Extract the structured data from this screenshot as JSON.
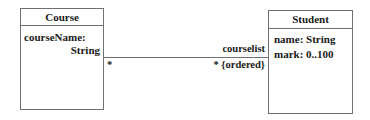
{
  "diagram": {
    "type": "UML class diagram",
    "classes": [
      {
        "name": "Course",
        "attributes": [
          {
            "line1": "courseName:",
            "line2": "String"
          }
        ]
      },
      {
        "name": "Student",
        "attributes": [
          {
            "text": "name: String"
          },
          {
            "text": "mark: 0..100"
          }
        ]
      }
    ],
    "association": {
      "source": "Course",
      "target": "Student",
      "source_multiplicity": "*",
      "target_role": "courselist",
      "target_multiplicity": "* {ordered}"
    }
  }
}
